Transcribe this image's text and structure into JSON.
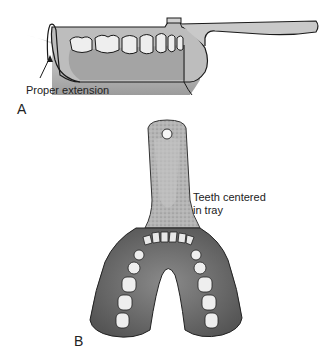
{
  "figure": {
    "panel_a": {
      "label": "A",
      "annotation": "Proper extension",
      "description": "Side view of impression tray seated over lower arch, showing proper tray border extension"
    },
    "panel_b": {
      "label": "B",
      "annotation_line1": "Teeth centered",
      "annotation_line2": "in tray",
      "description": "Occlusal view of mandibular impression tray with teeth centered"
    }
  },
  "colors": {
    "tray_light": "#c9c9c9",
    "tray_mid": "#a8a8a8",
    "tray_dark": "#6e6e6e",
    "outline": "#1a1a1a",
    "tooth": "#eeeeee"
  }
}
